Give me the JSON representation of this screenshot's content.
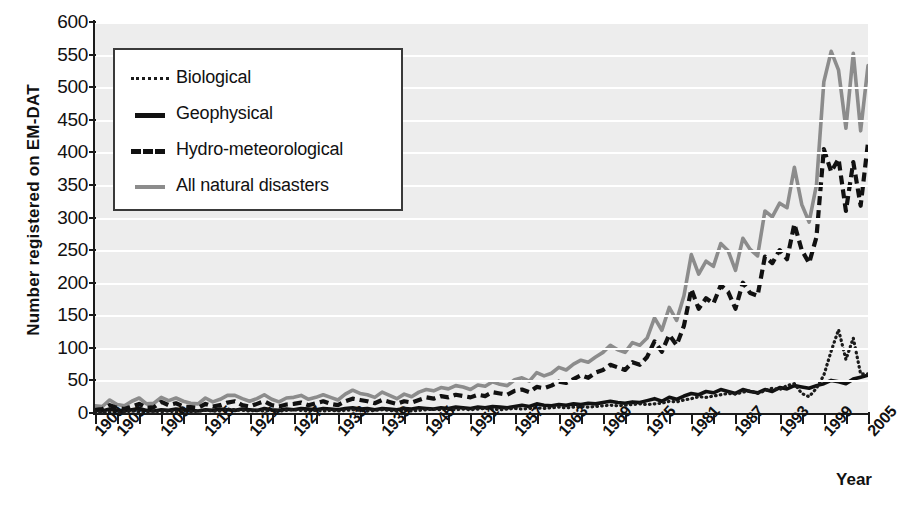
{
  "chart_data": {
    "type": "line",
    "title": "",
    "xlabel": "Year",
    "ylabel": "Number registered on EM-DAT",
    "xlim": [
      1900,
      2005
    ],
    "ylim": [
      0,
      600
    ],
    "ytick_step": 50,
    "yticks": [
      0,
      50,
      100,
      150,
      200,
      250,
      300,
      350,
      400,
      450,
      500,
      550,
      600
    ],
    "xticks": [
      "1900",
      "1903",
      "1909",
      "1915",
      "1921",
      "1927",
      "1933",
      "1939",
      "1945",
      "1951",
      "1957",
      "1963",
      "1969",
      "1975",
      "1981",
      "1987",
      "1993",
      "1999",
      "2005"
    ],
    "xtick_years": [
      1900,
      1903,
      1909,
      1915,
      1921,
      1927,
      1933,
      1939,
      1945,
      1951,
      1957,
      1963,
      1969,
      1975,
      1981,
      1987,
      1993,
      1999,
      2005
    ],
    "grid": "horizontal-white-on-gray",
    "legend_position": "top-left-inside",
    "plot_background": "#ededed",
    "gridline_color": "#ffffff",
    "x": [
      1900,
      1901,
      1902,
      1903,
      1904,
      1905,
      1906,
      1907,
      1908,
      1909,
      1910,
      1911,
      1912,
      1913,
      1914,
      1915,
      1916,
      1917,
      1918,
      1919,
      1920,
      1921,
      1922,
      1923,
      1924,
      1925,
      1926,
      1927,
      1928,
      1929,
      1930,
      1931,
      1932,
      1933,
      1934,
      1935,
      1936,
      1937,
      1938,
      1939,
      1940,
      1941,
      1942,
      1943,
      1944,
      1945,
      1946,
      1947,
      1948,
      1949,
      1950,
      1951,
      1952,
      1953,
      1954,
      1955,
      1956,
      1957,
      1958,
      1959,
      1960,
      1961,
      1962,
      1963,
      1964,
      1965,
      1966,
      1967,
      1968,
      1969,
      1970,
      1971,
      1972,
      1973,
      1974,
      1975,
      1976,
      1977,
      1978,
      1979,
      1980,
      1981,
      1982,
      1983,
      1984,
      1985,
      1986,
      1987,
      1988,
      1989,
      1990,
      1991,
      1992,
      1993,
      1994,
      1995,
      1996,
      1997,
      1998,
      1999,
      2000,
      2001,
      2002,
      2003,
      2004,
      2005
    ],
    "series": [
      {
        "name": "Biological",
        "style": "dotted",
        "color": "#1b1b1b",
        "values": [
          2,
          1,
          2,
          1,
          2,
          3,
          2,
          2,
          3,
          2,
          3,
          2,
          3,
          2,
          3,
          4,
          3,
          3,
          6,
          5,
          4,
          3,
          4,
          3,
          4,
          3,
          4,
          5,
          4,
          3,
          4,
          3,
          4,
          3,
          4,
          5,
          4,
          3,
          4,
          5,
          4,
          3,
          4,
          3,
          4,
          5,
          6,
          5,
          6,
          5,
          6,
          5,
          6,
          7,
          6,
          5,
          6,
          7,
          6,
          7,
          8,
          7,
          8,
          9,
          8,
          9,
          10,
          9,
          10,
          11,
          12,
          11,
          12,
          13,
          14,
          13,
          14,
          15,
          18,
          17,
          20,
          22,
          25,
          24,
          26,
          28,
          30,
          29,
          32,
          34,
          30,
          34,
          38,
          36,
          42,
          45,
          30,
          25,
          38,
          58,
          95,
          128,
          82,
          115,
          60,
          60
        ]
      },
      {
        "name": "Geophysical",
        "style": "solid",
        "color": "#111111",
        "values": [
          4,
          3,
          6,
          4,
          3,
          5,
          7,
          4,
          3,
          5,
          4,
          6,
          5,
          4,
          3,
          5,
          4,
          6,
          5,
          4,
          6,
          5,
          4,
          7,
          5,
          4,
          6,
          5,
          7,
          6,
          5,
          7,
          6,
          5,
          7,
          8,
          6,
          7,
          5,
          7,
          6,
          5,
          7,
          6,
          8,
          7,
          6,
          8,
          7,
          9,
          8,
          7,
          9,
          8,
          10,
          9,
          8,
          10,
          12,
          10,
          14,
          12,
          11,
          13,
          12,
          14,
          13,
          15,
          14,
          16,
          18,
          16,
          15,
          17,
          16,
          19,
          22,
          18,
          24,
          21,
          26,
          30,
          28,
          33,
          31,
          36,
          33,
          30,
          36,
          33,
          31,
          36,
          33,
          39,
          37,
          42,
          40,
          38,
          42,
          45,
          50,
          48,
          45,
          52,
          55,
          58
        ]
      },
      {
        "name": "Hydro-meteorological",
        "style": "dashed",
        "color": "#111111",
        "values": [
          5,
          6,
          12,
          8,
          6,
          10,
          14,
          8,
          9,
          17,
          12,
          15,
          10,
          9,
          8,
          14,
          10,
          12,
          16,
          18,
          12,
          10,
          14,
          18,
          12,
          10,
          13,
          14,
          16,
          12,
          15,
          18,
          14,
          12,
          18,
          22,
          20,
          18,
          15,
          20,
          17,
          14,
          18,
          16,
          20,
          24,
          22,
          26,
          24,
          28,
          26,
          24,
          28,
          26,
          32,
          30,
          28,
          34,
          36,
          32,
          40,
          38,
          42,
          48,
          46,
          52,
          58,
          54,
          62,
          66,
          74,
          70,
          66,
          78,
          74,
          86,
          110,
          94,
          120,
          104,
          134,
          190,
          160,
          176,
          168,
          196,
          186,
          160,
          200,
          184,
          180,
          240,
          230,
          250,
          236,
          290,
          250,
          230,
          270,
          405,
          370,
          390,
          310,
          385,
          318,
          415
        ]
      },
      {
        "name": "All natural disasters",
        "style": "solid",
        "color": "#8c8c8c",
        "values": [
          11,
          10,
          20,
          13,
          11,
          18,
          23,
          14,
          15,
          24,
          19,
          23,
          18,
          15,
          14,
          23,
          17,
          21,
          27,
          27,
          22,
          18,
          22,
          28,
          21,
          17,
          23,
          24,
          27,
          21,
          24,
          28,
          24,
          20,
          29,
          35,
          30,
          28,
          24,
          32,
          27,
          22,
          29,
          25,
          32,
          36,
          34,
          39,
          37,
          42,
          40,
          36,
          43,
          41,
          48,
          44,
          42,
          51,
          54,
          49,
          62,
          57,
          61,
          70,
          66,
          75,
          81,
          78,
          86,
          93,
          104,
          97,
          93,
          108,
          104,
          115,
          146,
          127,
          162,
          142,
          180,
          243,
          213,
          233,
          225,
          260,
          249,
          219,
          268,
          251,
          241,
          310,
          301,
          322,
          315,
          377,
          320,
          293,
          350,
          508,
          555,
          526,
          437,
          552,
          433,
          533
        ]
      }
    ]
  },
  "legend": {
    "items": [
      {
        "label": "Biological",
        "style": "dotted",
        "color": "#1b1b1b"
      },
      {
        "label": "Geophysical",
        "style": "solid",
        "color": "#111111"
      },
      {
        "label": "Hydro-meteorological",
        "style": "dashed",
        "color": "#111111"
      },
      {
        "label": "All natural disasters",
        "style": "solid-gray",
        "color": "#8c8c8c"
      }
    ]
  },
  "axes": {
    "y_title": "Number registered on EM-DAT",
    "x_title": "Year"
  }
}
